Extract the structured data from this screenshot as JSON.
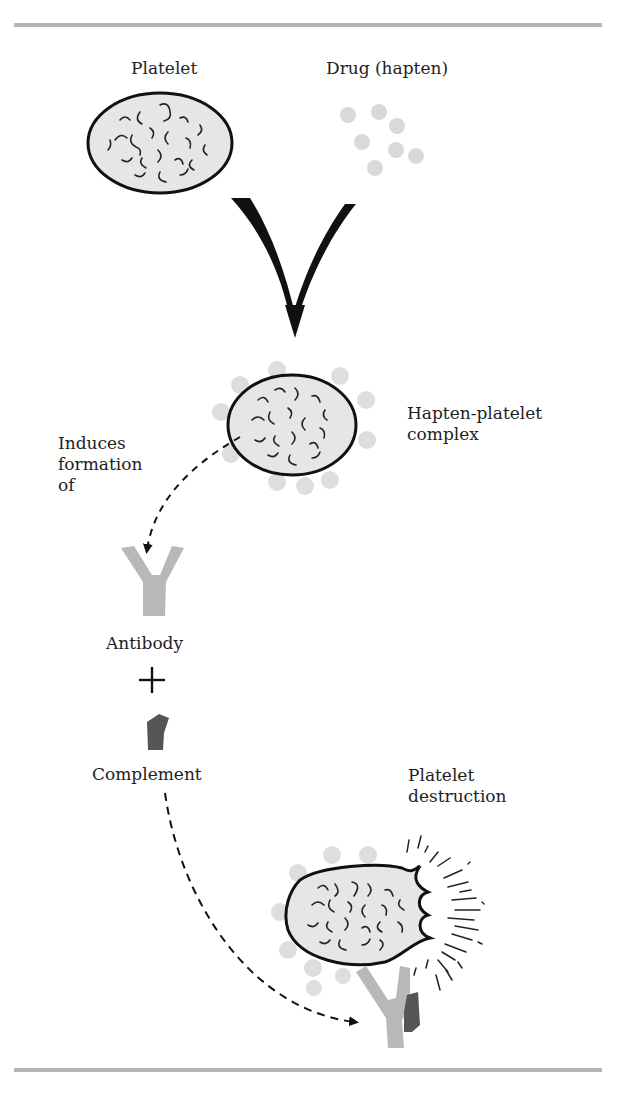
{
  "figure": {
    "rules": {
      "color": "#b3b3b3"
    },
    "labels": {
      "platelet": "Platelet",
      "drug": "Drug (hapten)",
      "complex": "Hapten-platelet\ncomplex",
      "induces": "Induces\nformation\nof",
      "antibody": "Antibody",
      "plus": "+",
      "complement": "Complement",
      "destruction": "Platelet\ndestruction"
    },
    "colors": {
      "platelet_fill": "#e6e6e6",
      "platelet_outline": "#111111",
      "hapten": "#d9d9d9",
      "antibody": "#b8b8b8",
      "complement": "#555555",
      "arrow": "#111111"
    },
    "steps": [
      "Platelet + Drug (hapten)",
      "Hapten-platelet complex",
      "Induces formation of Antibody",
      "Antibody + Complement",
      "Platelet destruction"
    ]
  }
}
